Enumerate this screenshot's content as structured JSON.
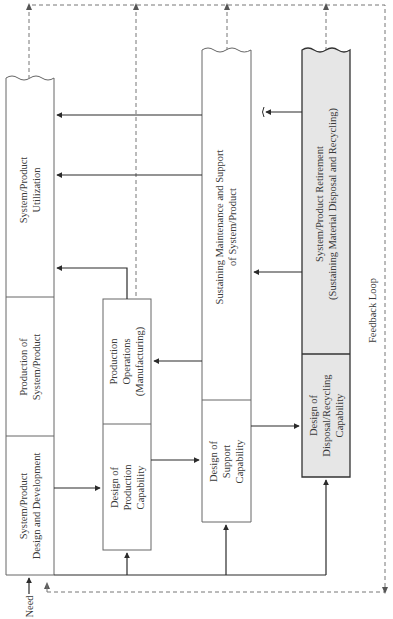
{
  "diagram": {
    "type": "flow",
    "columns": [
      {
        "id": "system-product",
        "segments": [
          {
            "label": "System/Product\nUtilization"
          },
          {
            "label": "Production of\nSystem/Product"
          },
          {
            "label": "System/Product\nDesign and Development"
          }
        ]
      },
      {
        "id": "production",
        "segments": [
          {
            "label": "Production\nOperations\n(Manufacturing)"
          },
          {
            "label": "Design of\nProduction\nCapability"
          }
        ]
      },
      {
        "id": "support",
        "segments": [
          {
            "label": "Sustaining Maintenance and Support\nof System/Product"
          },
          {
            "label": "Design of\nSupport\nCapability"
          }
        ]
      },
      {
        "id": "retirement",
        "segments": [
          {
            "label": "System/Product Retirement\n(Sustaining Material Disposal and Recycling)"
          },
          {
            "label": "Design of\nDisposal/Recycling\nCapability"
          }
        ]
      }
    ],
    "input_label": "Need",
    "feedback_label": "Feedback Loop",
    "colors": {
      "line": "#2b2b2b",
      "box_border": "#555555",
      "dashed": "#777777",
      "retirement_fill": "#e6e6e6"
    }
  }
}
